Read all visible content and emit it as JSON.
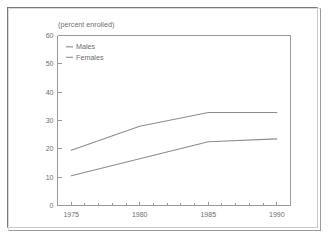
{
  "figure": {
    "note": "(percent enrolled)"
  },
  "chart_data": {
    "type": "line",
    "title": "",
    "subtitle": "(percent enrolled)",
    "xlabel": "",
    "ylabel": "",
    "ylim": [
      0,
      60
    ],
    "xlim": [
      1974,
      1991
    ],
    "grid": false,
    "legend_position": "top-left-inside",
    "y_ticks": [
      0,
      10,
      20,
      30,
      40,
      50,
      60
    ],
    "y_tick_labels": [
      "0",
      "10",
      "20",
      "30",
      "40",
      "50",
      "60"
    ],
    "x_ticks": [
      1975,
      1980,
      1985,
      1990
    ],
    "x_tick_labels": [
      "1975",
      "1980",
      "1985",
      "1990"
    ],
    "x_minor_ticks": [
      1976,
      1977,
      1978,
      1979,
      1981,
      1982,
      1983,
      1984,
      1986,
      1987,
      1988,
      1989
    ],
    "x": [
      1975,
      1980,
      1985,
      1990
    ],
    "series": [
      {
        "name": "Males",
        "color": "#8d8d8d",
        "values": [
          19.5,
          28.0,
          32.8,
          32.8
        ]
      },
      {
        "name": "Females",
        "color": "#8d8d8d",
        "values": [
          10.5,
          16.5,
          22.5,
          23.5
        ]
      }
    ],
    "legend": [
      "Males",
      "Females"
    ]
  }
}
